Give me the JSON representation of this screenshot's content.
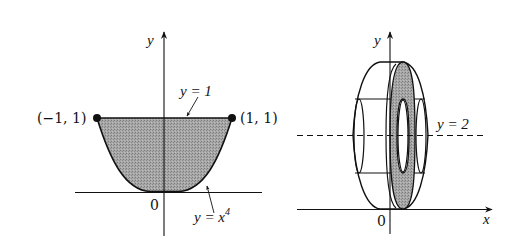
{
  "figure_left": {
    "axis_y_label": "y",
    "origin_label": "0",
    "line_label": "y = 1",
    "curve_label_base": "y = x",
    "curve_label_exp": "4",
    "point_left_label": "(−1, 1)",
    "point_right_label": "(1, 1)",
    "region": "area between y = x^4 and y = 1 for −1 ≤ x ≤ 1, shaded"
  },
  "figure_right": {
    "axis_y_label": "y",
    "axis_x_label": "x",
    "origin_label": "0",
    "axis_of_rotation_label": "y = 2",
    "description": "solid of revolution about y = 2 with shaded washer cross-section"
  },
  "colors": {
    "ink": "#111111",
    "shade": "#9a9a9a",
    "background": "#ffffff"
  }
}
